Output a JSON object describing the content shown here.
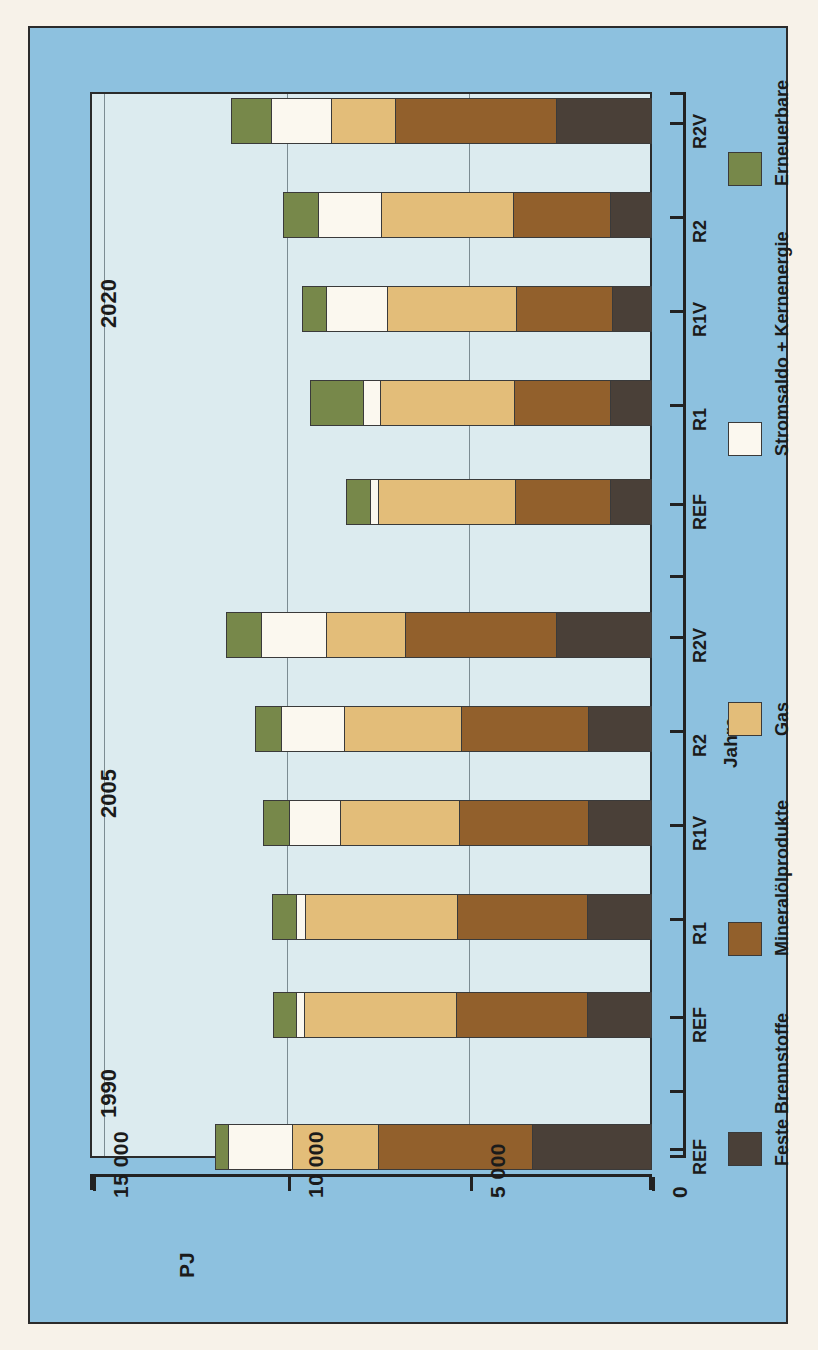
{
  "chart_data": {
    "type": "bar",
    "orientation": "horizontal-stacked",
    "title": "",
    "xlabel": "PJ",
    "ylabel": "Jahre",
    "unit": "PJ",
    "xlim": [
      0,
      15000
    ],
    "xticks": [
      15000,
      10000,
      5000,
      0
    ],
    "xtick_labels": [
      "15 000",
      "10 000",
      "5 000",
      "0"
    ],
    "grid": true,
    "grid_axis": "x",
    "legend_position": "right",
    "axis_direction": "value increases to the left; zero at right",
    "group_labels": [
      "2020",
      "2005",
      "1990"
    ],
    "categories": [
      "REF",
      "R1",
      "R1V",
      "R2",
      "R2V",
      "REF",
      "R1",
      "R1V",
      "R2",
      "R2V",
      "REF"
    ],
    "groups": [
      {
        "year": "2020",
        "scenarios": [
          "REF",
          "R1",
          "R1V",
          "R2",
          "R2V"
        ]
      },
      {
        "year": "2005",
        "scenarios": [
          "REF",
          "R1",
          "R1V",
          "R2",
          "R2V"
        ]
      },
      {
        "year": "1990",
        "scenarios": [
          "REF"
        ]
      }
    ],
    "series": [
      {
        "name": "Feste Brennstoffe",
        "color": "#4a4038",
        "values": [
          2620,
          1120,
          1080,
          1120,
          1120,
          2620,
          1730,
          1730,
          1760,
          1760,
          3260
        ]
      },
      {
        "name": "Mineralölprodukte",
        "color": "#92602c",
        "values": [
          4420,
          2690,
          2640,
          2640,
          2620,
          4140,
          3490,
          3560,
          3590,
          3610,
          4240
        ]
      },
      {
        "name": "Gas",
        "color": "#e3bd79",
        "values": [
          1760,
          3620,
          3560,
          3700,
          3790,
          2180,
          3220,
          3260,
          4160,
          4180,
          2360
        ]
      },
      {
        "name": "Stromsaldo + Kernenergie",
        "color": "#fbf8ef",
        "values": [
          1650,
          1730,
          1680,
          470,
          200,
          1790,
          1730,
          1410,
          260,
          210,
          1760
        ]
      },
      {
        "name": "Erneuerbare",
        "color": "#77884a",
        "values": [
          1080,
          940,
          620,
          1420,
          640,
          940,
          700,
          700,
          620,
          620,
          340
        ]
      }
    ],
    "bar_order_note": "bars listed top to bottom: 2020 R2V, 2020 R2, 2020 R1V, 2020 R1, 2020 REF, 2005 R2V, 2005 R2, 2005 R1V, 2005 R1, 2005 REF, 1990 REF"
  },
  "axes": {
    "value_axis": {
      "unit_label": "PJ",
      "ticks": [
        {
          "label": "15 000",
          "value": 15000
        },
        {
          "label": "10 000",
          "value": 10000
        },
        {
          "label": "5 000",
          "value": 5000
        },
        {
          "label": "0",
          "value": 0
        }
      ]
    },
    "category_axis": {
      "title": "Jahre",
      "ticks": [
        "R2V",
        "R2",
        "R1V",
        "R1",
        "REF",
        "R2V",
        "R2",
        "R1V",
        "R1",
        "REF",
        "REF"
      ]
    },
    "year_markers": [
      {
        "label": "2020"
      },
      {
        "label": "2005"
      },
      {
        "label": "1990"
      }
    ]
  },
  "legend": {
    "items": [
      {
        "label": "Erneuerbare",
        "color": "#77884a"
      },
      {
        "label": "Stromsaldo + Kernenergie",
        "color": "#fbf8ef"
      },
      {
        "label": "Gas",
        "color": "#e3bd79"
      },
      {
        "label": "Mineralölprodukte",
        "color": "#92602c"
      },
      {
        "label": "Feste Brennstoffe",
        "color": "#4a4038"
      }
    ]
  },
  "colors": {
    "panel_background": "#8dc1df",
    "plot_background": "#dcebef",
    "page_background": "#f7f2e9",
    "ink": "#1b1b1b"
  }
}
